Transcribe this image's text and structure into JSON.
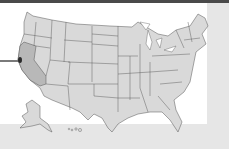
{
  "map": {
    "type": "us-states-choropleth",
    "highlighted_state": "California",
    "marker": {
      "location": "San Francisco Bay Area",
      "color": "#2a2a2a"
    },
    "colors": {
      "state_fill": "#d9d9d9",
      "highlight_fill": "#b8b8b8",
      "border": "#555555",
      "panel": "#ffffff",
      "background": "#e6e6e6",
      "top_bar": "#4a4a4a",
      "leader_line": "#7a7a7a"
    },
    "insets": [
      "Alaska",
      "Hawaii"
    ]
  }
}
